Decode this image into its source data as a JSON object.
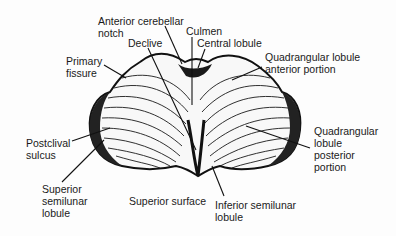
{
  "figure": {
    "labels": [
      {
        "id": "anterior-cerebellar-notch",
        "text": "Anterior cerebellar\nnotch",
        "x": 98,
        "y": 15
      },
      {
        "id": "culmen",
        "text": "Culmen",
        "x": 186,
        "y": 25
      },
      {
        "id": "declive",
        "text": "Declive",
        "x": 128,
        "y": 37
      },
      {
        "id": "central-lobule",
        "text": "Central lobule",
        "x": 197,
        "y": 37
      },
      {
        "id": "primary-fissure",
        "text": "Primary\nfissure",
        "x": 66,
        "y": 55
      },
      {
        "id": "quadrangular-lobule-anterior",
        "text": "Quadrangular lobule\nanterior portion",
        "x": 265,
        "y": 51
      },
      {
        "id": "postclival-sulcus",
        "text": "Postclival\nsulcus",
        "x": 26,
        "y": 137
      },
      {
        "id": "quadrangular-lobule-posterior",
        "text": "Quadrangular\nlobule\nposterior\nportion",
        "x": 314,
        "y": 125
      },
      {
        "id": "superior-semilunar-lobule",
        "text": "Superior\nsemilunar\nlobule",
        "x": 42,
        "y": 183
      },
      {
        "id": "superior-surface",
        "text": "Superior surface",
        "x": 129,
        "y": 195
      },
      {
        "id": "inferior-semilunar-lobule",
        "text": "Inferior semilunar\nlobule",
        "x": 215,
        "y": 199
      }
    ]
  }
}
